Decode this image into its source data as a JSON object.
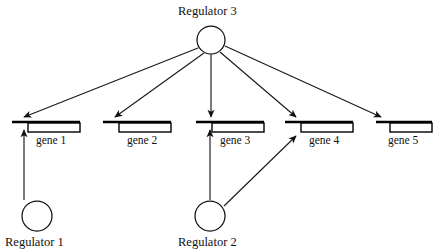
{
  "diagram": {
    "type": "regulatory-network",
    "background_color": "#ffffff",
    "line_color": "#111111",
    "width": 436,
    "height": 250
  },
  "regulators": [
    {
      "id": "regulator-1",
      "label": "Regulator 1",
      "shape": "circle",
      "cx": 37,
      "cy": 216,
      "r": 15,
      "label_x": 5,
      "label_y": 236
    },
    {
      "id": "regulator-2",
      "label": "Regulator 2",
      "shape": "circle",
      "cx": 210,
      "cy": 216,
      "r": 15,
      "label_x": 178,
      "label_y": 236
    },
    {
      "id": "regulator-3",
      "label": "Regulator 3",
      "shape": "circle",
      "cx": 211,
      "cy": 40,
      "r": 14,
      "label_x": 178,
      "label_y": 5
    }
  ],
  "genes": [
    {
      "id": "gene-1",
      "label": "gene 1",
      "promoter_x1": 12,
      "promoter_x2": 80,
      "promoter_y": 122,
      "box_x": 28,
      "box_y": 123,
      "box_w": 52,
      "box_h": 9,
      "label_x": 36,
      "label_y": 135
    },
    {
      "id": "gene-2",
      "label": "gene 2",
      "promoter_x1": 103,
      "promoter_x2": 171,
      "promoter_y": 122,
      "box_x": 119,
      "box_y": 123,
      "box_w": 52,
      "box_h": 9,
      "label_x": 127,
      "label_y": 135
    },
    {
      "id": "gene-3",
      "label": "gene 3",
      "promoter_x1": 196,
      "promoter_x2": 264,
      "promoter_y": 122,
      "box_x": 212,
      "box_y": 123,
      "box_w": 52,
      "box_h": 9,
      "label_x": 220,
      "label_y": 135
    },
    {
      "id": "gene-4",
      "label": "gene 4",
      "promoter_x1": 285,
      "promoter_x2": 353,
      "promoter_y": 122,
      "box_x": 301,
      "box_y": 123,
      "box_w": 52,
      "box_h": 9,
      "label_x": 309,
      "label_y": 135
    },
    {
      "id": "gene-5",
      "label": "gene 5",
      "promoter_x1": 376,
      "promoter_x2": 432,
      "promoter_y": 122,
      "box_x": 390,
      "box_y": 123,
      "box_w": 42,
      "box_h": 9,
      "label_x": 388,
      "label_y": 135
    }
  ],
  "edges": [
    {
      "id": "edge-regulator3-gene1",
      "from": "regulator-3",
      "to": "gene-1",
      "kind": "activation-arrow",
      "x1": 198,
      "y1": 48,
      "x2": 24,
      "y2": 117
    },
    {
      "id": "edge-regulator3-gene2",
      "from": "regulator-3",
      "to": "gene-2",
      "kind": "activation-arrow",
      "x1": 204,
      "y1": 53,
      "x2": 115,
      "y2": 117
    },
    {
      "id": "edge-regulator3-gene3",
      "from": "regulator-3",
      "to": "gene-3",
      "kind": "activation-arrow",
      "x1": 211,
      "y1": 55,
      "x2": 211,
      "y2": 117
    },
    {
      "id": "edge-regulator3-gene4",
      "from": "regulator-3",
      "to": "gene-4",
      "kind": "activation-arrow",
      "x1": 220,
      "y1": 52,
      "x2": 296,
      "y2": 117
    },
    {
      "id": "edge-regulator3-gene5",
      "from": "regulator-3",
      "to": "gene-5",
      "kind": "activation-arrow",
      "x1": 225,
      "y1": 46,
      "x2": 381,
      "y2": 117
    },
    {
      "id": "edge-regulator1-gene1",
      "from": "regulator-1",
      "to": "gene-1",
      "kind": "activation-arrow",
      "x1": 24,
      "y1": 200,
      "x2": 24,
      "y2": 130
    },
    {
      "id": "edge-regulator2-gene3",
      "from": "regulator-2",
      "to": "gene-3",
      "kind": "activation-arrow",
      "x1": 210,
      "y1": 200,
      "x2": 210,
      "y2": 130
    },
    {
      "id": "edge-regulator2-gene4",
      "from": "regulator-2",
      "to": "gene-4",
      "kind": "activation-arrow",
      "x1": 224,
      "y1": 206,
      "x2": 296,
      "y2": 136
    }
  ]
}
